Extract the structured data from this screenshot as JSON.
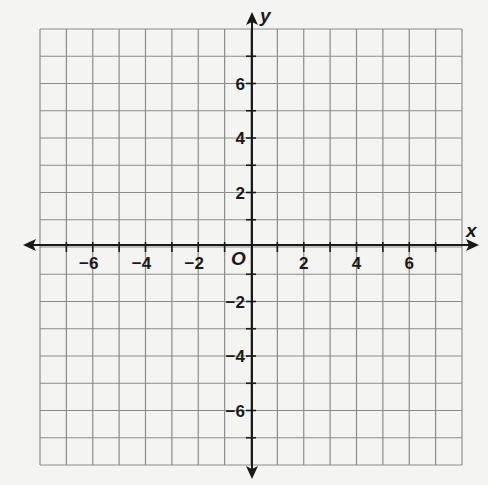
{
  "chart_data": {
    "type": "coordinate-grid",
    "title": "",
    "xlabel": "x",
    "ylabel": "y",
    "origin_label": "O",
    "xlim": [
      -8,
      8
    ],
    "ylim": [
      -8,
      8
    ],
    "grid": true,
    "grid_step": 1,
    "x_ticks": [
      -6,
      -4,
      -2,
      2,
      4,
      6
    ],
    "y_ticks": [
      6,
      4,
      2,
      -2,
      -4,
      -6
    ],
    "x_tick_labels": [
      "−6",
      "−4",
      "−2",
      "2",
      "4",
      "6"
    ],
    "y_tick_labels": [
      "6",
      "4",
      "2",
      "−2",
      "−4",
      "−6"
    ],
    "series": []
  },
  "colors": {
    "background": "#f4f4f2",
    "grid": "#8c8c8c",
    "axis": "#1a1a1a"
  }
}
